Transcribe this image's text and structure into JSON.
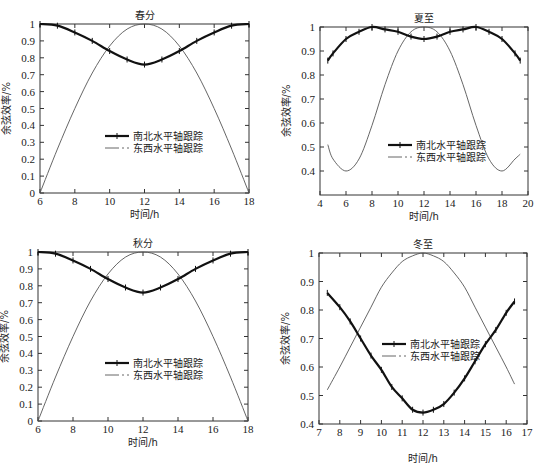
{
  "chart_data": [
    {
      "type": "line",
      "title": "春分",
      "xlabel": "时间/h",
      "ylabel": "余弦效率/%",
      "xlim": [
        6,
        18
      ],
      "ylim": [
        0,
        1
      ],
      "xticks": [
        6,
        8,
        10,
        12,
        14,
        16,
        18
      ],
      "yticks": [
        0,
        0.1,
        0.2,
        0.3,
        0.4,
        0.5,
        0.6,
        0.7,
        0.8,
        0.9,
        1
      ],
      "legend": [
        "南北水平轴跟踪",
        "东西水平轴跟踪"
      ],
      "series": [
        {
          "name": "南北水平轴跟踪",
          "x": [
            6,
            7,
            8,
            9,
            10,
            11,
            12,
            13,
            14,
            15,
            16,
            17,
            18
          ],
          "values": [
            1.0,
            0.99,
            0.95,
            0.9,
            0.84,
            0.79,
            0.76,
            0.79,
            0.84,
            0.9,
            0.95,
            0.99,
            1.0
          ]
        },
        {
          "name": "东西水平轴跟踪",
          "x": [
            6,
            7,
            8,
            9,
            10,
            11,
            12,
            13,
            14,
            15,
            16,
            17,
            18
          ],
          "values": [
            0.0,
            0.26,
            0.5,
            0.71,
            0.87,
            0.97,
            1.0,
            0.97,
            0.87,
            0.71,
            0.5,
            0.26,
            0.0
          ]
        }
      ]
    },
    {
      "type": "line",
      "title": "夏至",
      "xlabel": "时间/h",
      "ylabel": "余弦效率/%",
      "xlim": [
        4,
        20
      ],
      "ylim": [
        0.3,
        1
      ],
      "xticks": [
        4,
        6,
        8,
        10,
        12,
        14,
        16,
        18,
        20
      ],
      "yticks": [
        0.4,
        0.5,
        0.6,
        0.7,
        0.8,
        0.9,
        1
      ],
      "legend": [
        "南北水平轴跟踪",
        "东西水平轴跟踪"
      ],
      "series": [
        {
          "name": "南北水平轴跟踪",
          "x": [
            4.6,
            5,
            6,
            7,
            8,
            9,
            10,
            11,
            12,
            13,
            14,
            15,
            16,
            17,
            18,
            19,
            19.4
          ],
          "values": [
            0.86,
            0.89,
            0.95,
            0.98,
            1.0,
            0.99,
            0.98,
            0.96,
            0.95,
            0.96,
            0.98,
            0.99,
            1.0,
            0.98,
            0.95,
            0.89,
            0.86
          ]
        },
        {
          "name": "东西水平轴跟踪",
          "x": [
            4.6,
            5,
            6,
            7,
            8,
            9,
            10,
            11,
            12,
            13,
            14,
            15,
            16,
            17,
            18,
            19,
            19.4
          ],
          "values": [
            0.51,
            0.45,
            0.4,
            0.45,
            0.59,
            0.76,
            0.9,
            0.98,
            1.0,
            0.98,
            0.9,
            0.76,
            0.59,
            0.45,
            0.4,
            0.45,
            0.47
          ]
        }
      ]
    },
    {
      "type": "line",
      "title": "秋分",
      "xlabel": "时间/h",
      "ylabel": "余弦效率/%",
      "xlim": [
        6,
        18
      ],
      "ylim": [
        0,
        1
      ],
      "xticks": [
        6,
        8,
        10,
        12,
        14,
        16,
        18
      ],
      "yticks": [
        0,
        0.1,
        0.2,
        0.3,
        0.4,
        0.5,
        0.6,
        0.7,
        0.8,
        0.9,
        1
      ],
      "legend": [
        "南北水平轴跟踪",
        "东西水平轴跟踪"
      ],
      "series": [
        {
          "name": "南北水平轴跟踪",
          "x": [
            6,
            7,
            8,
            9,
            10,
            11,
            12,
            13,
            14,
            15,
            16,
            17,
            18
          ],
          "values": [
            1.0,
            0.99,
            0.95,
            0.9,
            0.84,
            0.79,
            0.76,
            0.79,
            0.84,
            0.9,
            0.95,
            0.99,
            1.0
          ]
        },
        {
          "name": "东西水平轴跟踪",
          "x": [
            6,
            7,
            8,
            9,
            10,
            11,
            12,
            13,
            14,
            15,
            16,
            17,
            18
          ],
          "values": [
            0.0,
            0.26,
            0.5,
            0.71,
            0.87,
            0.97,
            1.0,
            0.97,
            0.87,
            0.71,
            0.5,
            0.26,
            0.0
          ]
        }
      ]
    },
    {
      "type": "line",
      "title": "冬至",
      "xlabel": "时间/h",
      "ylabel": "余弦效率/%",
      "xlim": [
        7,
        17
      ],
      "ylim": [
        0.4,
        1
      ],
      "xticks": [
        7,
        8,
        9,
        10,
        11,
        12,
        13,
        14,
        15,
        16,
        17
      ],
      "yticks": [
        0.4,
        0.5,
        0.6,
        0.7,
        0.8,
        0.9,
        1
      ],
      "legend": [
        "南北水平轴跟踪",
        "东西水平轴跟踪"
      ],
      "series": [
        {
          "name": "南北水平轴跟踪",
          "x": [
            7.4,
            8,
            8.5,
            9,
            9.5,
            10,
            10.5,
            11,
            11.5,
            12,
            12.5,
            13,
            13.5,
            14,
            14.5,
            15,
            15.5,
            16,
            16.4
          ],
          "values": [
            0.86,
            0.81,
            0.76,
            0.7,
            0.64,
            0.59,
            0.53,
            0.49,
            0.45,
            0.44,
            0.45,
            0.47,
            0.51,
            0.56,
            0.62,
            0.68,
            0.73,
            0.79,
            0.83
          ]
        },
        {
          "name": "东西水平轴跟踪",
          "x": [
            7.4,
            8,
            8.5,
            9,
            9.5,
            10,
            10.5,
            11,
            11.5,
            12,
            12.5,
            13,
            13.5,
            14,
            14.5,
            15,
            15.5,
            16,
            16.4
          ],
          "values": [
            0.52,
            0.6,
            0.67,
            0.74,
            0.81,
            0.88,
            0.93,
            0.97,
            0.99,
            1.0,
            0.99,
            0.97,
            0.93,
            0.88,
            0.81,
            0.74,
            0.67,
            0.6,
            0.54
          ]
        }
      ]
    }
  ]
}
